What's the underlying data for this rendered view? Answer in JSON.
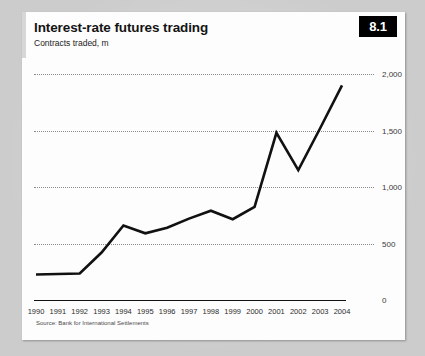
{
  "card": {
    "title": "Interest-rate futures trading",
    "subtitle": "Contracts traded, m",
    "badge": "8.1",
    "source": "Source: Bank for International Settlements"
  },
  "colors": {
    "page_background": "#cccccc",
    "card_background": "#fdfdfd",
    "badge_background": "#000000",
    "badge_text": "#ffffff",
    "series_line": "#111111",
    "gridline": "#8a8a8a",
    "axis": "#111111"
  },
  "chart_data": {
    "type": "line",
    "title": "Interest-rate futures trading",
    "subtitle": "Contracts traded, m",
    "xlabel": "",
    "ylabel": "Contracts traded, m",
    "ylim": [
      0,
      2000
    ],
    "yticks": [
      0,
      500,
      1000,
      1500,
      2000
    ],
    "ytick_labels": [
      "0",
      "500",
      "1,000",
      "1,500",
      "2,000"
    ],
    "grid": true,
    "grid_style": "dotted",
    "legend": false,
    "legend_position": "none",
    "categories": [
      "1990",
      "1991",
      "1992",
      "1993",
      "1994",
      "1995",
      "1996",
      "1997",
      "1998",
      "1999",
      "2000",
      "2001",
      "2002",
      "2003",
      "2004"
    ],
    "x": [
      1990,
      1991,
      1992,
      1993,
      1994,
      1995,
      1996,
      1997,
      1998,
      1999,
      2000,
      2001,
      2002,
      2003,
      2004
    ],
    "values": [
      225,
      230,
      235,
      420,
      660,
      590,
      640,
      720,
      790,
      715,
      825,
      1480,
      1150,
      1520,
      1900
    ],
    "series": [
      {
        "name": "Contracts traded, m",
        "values": [
          225,
          230,
          235,
          420,
          660,
          590,
          640,
          720,
          790,
          715,
          825,
          1480,
          1150,
          1520,
          1900
        ]
      }
    ],
    "source": "Source: Bank for International Settlements"
  }
}
